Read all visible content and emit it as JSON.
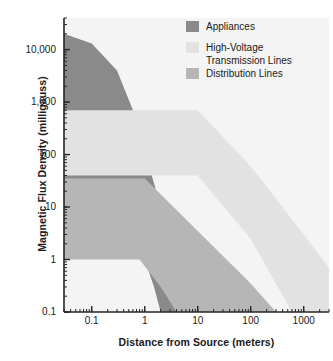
{
  "chart_data": {
    "type": "area",
    "title": "",
    "xlabel": "Distance from Source (meters)",
    "ylabel": "Magnetic Flux Density (milligauss)",
    "xscale": "log",
    "yscale": "log",
    "xlim": [
      0.03,
      3000
    ],
    "ylim": [
      0.1,
      40000
    ],
    "grid": false,
    "legend_position": "top-right",
    "xticks": [
      {
        "value": 0.1,
        "label": "0.1"
      },
      {
        "value": 1,
        "label": "1"
      },
      {
        "value": 10,
        "label": "10"
      },
      {
        "value": 100,
        "label": "100"
      },
      {
        "value": 1000,
        "label": "1000"
      }
    ],
    "yticks": [
      {
        "value": 10000,
        "label": "10,000"
      },
      {
        "value": 1000,
        "label": "1,000"
      },
      {
        "value": 100,
        "label": "100"
      },
      {
        "value": 10,
        "label": "10"
      },
      {
        "value": 1,
        "label": "1"
      },
      {
        "value": 0.1,
        "label": "0.1"
      }
    ],
    "series": [
      {
        "name": "Appliances",
        "color": "#8a8a8a",
        "upper": [
          {
            "x": 0.03,
            "y": 20000
          },
          {
            "x": 0.1,
            "y": 13000
          },
          {
            "x": 0.3,
            "y": 4000
          },
          {
            "x": 0.6,
            "y": 700
          },
          {
            "x": 1.0,
            "y": 120
          },
          {
            "x": 2.0,
            "y": 10
          },
          {
            "x": 3.0,
            "y": 1.5
          },
          {
            "x": 4.0,
            "y": 0.35
          },
          {
            "x": 5.0,
            "y": 0.1
          }
        ],
        "lower": [
          {
            "x": 0.03,
            "y": 7
          },
          {
            "x": 0.1,
            "y": 7
          },
          {
            "x": 0.3,
            "y": 5
          },
          {
            "x": 0.6,
            "y": 2.5
          },
          {
            "x": 1.0,
            "y": 1.0
          },
          {
            "x": 1.5,
            "y": 0.3
          },
          {
            "x": 2.0,
            "y": 0.1
          }
        ]
      },
      {
        "name": "High-Voltage\nTransmission Lines",
        "color": "#e2e2e2",
        "upper": [
          {
            "x": 0.03,
            "y": 700
          },
          {
            "x": 10,
            "y": 700
          },
          {
            "x": 100,
            "y": 60
          },
          {
            "x": 1000,
            "y": 3
          },
          {
            "x": 3000,
            "y": 0.7
          }
        ],
        "lower": [
          {
            "x": 0.03,
            "y": 40
          },
          {
            "x": 10,
            "y": 40
          },
          {
            "x": 100,
            "y": 2.5
          },
          {
            "x": 600,
            "y": 0.1
          },
          {
            "x": 3000,
            "y": 0.1
          }
        ]
      },
      {
        "name": "Distribution Lines",
        "color": "#b6b6b6",
        "upper": [
          {
            "x": 0.03,
            "y": 35
          },
          {
            "x": 1,
            "y": 35
          },
          {
            "x": 10,
            "y": 3.5
          },
          {
            "x": 100,
            "y": 0.35
          },
          {
            "x": 300,
            "y": 0.1
          }
        ],
        "lower": [
          {
            "x": 0.03,
            "y": 1
          },
          {
            "x": 0.8,
            "y": 1
          },
          {
            "x": 2,
            "y": 0.3
          },
          {
            "x": 4,
            "y": 0.1
          },
          {
            "x": 300,
            "y": 0.1
          }
        ]
      }
    ]
  },
  "legend": {
    "items": [
      {
        "label": "Appliances",
        "color": "#8a8a8a"
      },
      {
        "label": "High-Voltage\nTransmission Lines",
        "color": "#e2e2e2"
      },
      {
        "label": "Distribution Lines",
        "color": "#b6b6b6"
      }
    ]
  },
  "axes": {
    "x_title": "Distance from Source (meters)",
    "y_title": "Magnetic Flux Density (milligauss)"
  },
  "style": {
    "plot_background": "#f4f4f4",
    "axis_color": "#262626",
    "text_color": "#1a1a1a"
  }
}
